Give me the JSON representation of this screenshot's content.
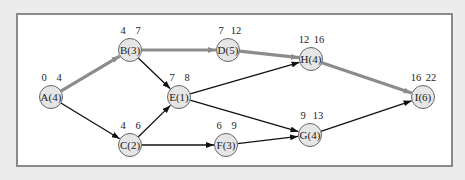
{
  "diagram": {
    "type": "activity-on-node network (critical path)",
    "colors": {
      "background": "#ececec",
      "frame_fill": "#ffffff",
      "frame_border": "#8a8a8a",
      "node_fill": "#e6e6e6",
      "node_stroke": "#666666",
      "edge": "#111111",
      "critical_edge": "#8c8c8c"
    },
    "nodes": [
      {
        "id": "A",
        "label": "A(4)",
        "es": "0",
        "ef": "4",
        "x": 51,
        "y": 97
      },
      {
        "id": "B",
        "label": "B(3)",
        "es": "4",
        "ef": "7",
        "x": 130,
        "y": 50
      },
      {
        "id": "C",
        "label": "C(2)",
        "es": "4",
        "ef": "6",
        "x": 130,
        "y": 145
      },
      {
        "id": "D",
        "label": "D(5)",
        "es": "7",
        "ef": "12",
        "x": 228,
        "y": 50
      },
      {
        "id": "E",
        "label": "E(1)",
        "es": "7",
        "ef": "8",
        "x": 179,
        "y": 97
      },
      {
        "id": "F",
        "label": "F(3)",
        "es": "6",
        "ef": "9",
        "x": 226,
        "y": 145
      },
      {
        "id": "G",
        "label": "G(4)",
        "es": "9",
        "ef": "13",
        "x": 310,
        "y": 135
      },
      {
        "id": "H",
        "label": "H(4)",
        "es": "12",
        "ef": "16",
        "x": 311,
        "y": 59
      },
      {
        "id": "I",
        "label": "I(6)",
        "es": "16",
        "ef": "22",
        "x": 423,
        "y": 97
      }
    ],
    "edges": [
      {
        "from": "A",
        "to": "B",
        "critical": true
      },
      {
        "from": "A",
        "to": "C",
        "critical": false
      },
      {
        "from": "B",
        "to": "D",
        "critical": true
      },
      {
        "from": "B",
        "to": "E",
        "critical": false
      },
      {
        "from": "C",
        "to": "E",
        "critical": false
      },
      {
        "from": "C",
        "to": "F",
        "critical": false
      },
      {
        "from": "D",
        "to": "H",
        "critical": true
      },
      {
        "from": "E",
        "to": "H",
        "critical": false
      },
      {
        "from": "E",
        "to": "G",
        "critical": false
      },
      {
        "from": "F",
        "to": "G",
        "critical": false
      },
      {
        "from": "G",
        "to": "I",
        "critical": false
      },
      {
        "from": "H",
        "to": "I",
        "critical": true
      }
    ],
    "critical_path": [
      "A",
      "B",
      "D",
      "H",
      "I"
    ]
  }
}
